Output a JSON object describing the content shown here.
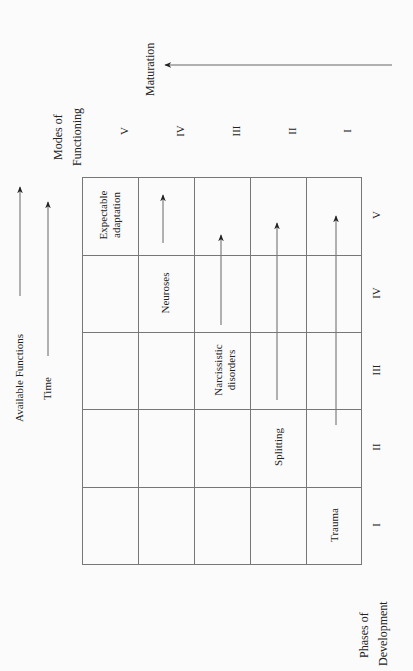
{
  "diagram": {
    "left_axis": {
      "available_functions_label": "Available Functions",
      "time_label": "Time"
    },
    "top_axis": {
      "title_line1": "Modes of",
      "title_line2": "Functioning",
      "modes": [
        "V",
        "IV",
        "III",
        "II",
        "I"
      ],
      "maturation_label": "Maturation"
    },
    "bottom_axis": {
      "title_line1": "Phases of",
      "title_line2": "Development",
      "phases": [
        "V",
        "IV",
        "III",
        "II",
        "I"
      ]
    },
    "cells": {
      "expectable_line1": "Expectable",
      "expectable_line2": "adaptation",
      "neuroses": "Neuroses",
      "narcissistic_line1": "Narcissistic",
      "narcissistic_line2": "disorders",
      "splitting": "Splitting",
      "trauma": "Trauma"
    },
    "colors": {
      "line": "#777777",
      "arrow": "#222222",
      "text": "#222222",
      "background": "#fbfbfb"
    }
  }
}
